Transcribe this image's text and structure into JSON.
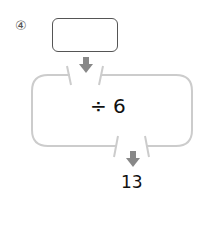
{
  "problem": {
    "number": "④",
    "input_value": "",
    "operation": "÷ 6",
    "output_value": "13"
  },
  "colors": {
    "machine_outline": "#cccccc",
    "arrow": "#888888",
    "input_border": "#555555"
  }
}
